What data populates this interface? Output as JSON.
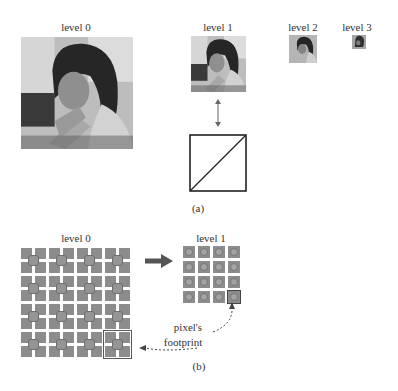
{
  "part_a": {
    "levels": [
      {
        "label": "level 0"
      },
      {
        "label": "level 1"
      },
      {
        "label": "level 2"
      },
      {
        "label": "level 3"
      }
    ],
    "caption": "(a)"
  },
  "part_b": {
    "level0_label": "level 0",
    "level1_label": "level 1",
    "grid_rows": 4,
    "grid_cols": 4,
    "annotation_line1": "pixel's",
    "annotation_line2": "footprint",
    "caption": "(b)"
  },
  "colors": {
    "cell_gray": "#8c8c8c",
    "dot_gray": "#959595",
    "line": "#333333"
  }
}
